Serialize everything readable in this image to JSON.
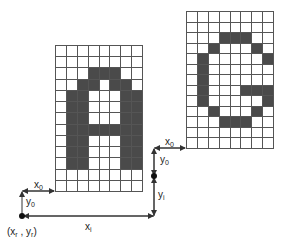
{
  "figure": {
    "glyphs": [
      {
        "id": "A",
        "cols": 8,
        "rows": 13,
        "position": {
          "x": 55,
          "y": 45,
          "width": 88,
          "height": 147
        },
        "bitmap": [
          "00000000",
          "00000000",
          "00011100",
          "00110110",
          "01100011",
          "01100011",
          "01100011",
          "01111111",
          "01100011",
          "01100011",
          "01100011",
          "00000000",
          "00000000"
        ]
      },
      {
        "id": "C",
        "cols": 8,
        "rows": 13,
        "position": {
          "x": 186,
          "y": 11,
          "width": 88,
          "height": 138
        },
        "bitmap": [
          "00000000",
          "00000000",
          "00011100",
          "00100010",
          "01000001",
          "01000000",
          "01000000",
          "01000111",
          "01000001",
          "00100010",
          "00011100",
          "00000000",
          "00000000"
        ]
      }
    ],
    "labels": {
      "x0_left": {
        "base": "x",
        "sub": "0"
      },
      "y0_left": {
        "base": "y",
        "sub": "0"
      },
      "origin": {
        "text": "(x",
        "sub1": "r",
        "mid": " , y",
        "sub2": "r",
        "end": ")"
      },
      "xi": {
        "base": "x",
        "sub": "i"
      },
      "yi": {
        "base": "y",
        "sub": "i"
      },
      "x0_right": {
        "base": "x",
        "sub": "0"
      },
      "y0_right": {
        "base": "y",
        "sub": "0"
      }
    },
    "colors": {
      "fill": "#4a4a4a",
      "grid": "#555555",
      "line": "#333333",
      "background": "#ffffff"
    }
  }
}
